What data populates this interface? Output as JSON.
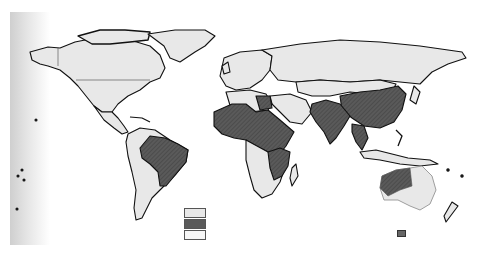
{
  "map": {
    "type": "world-choropleth",
    "style": "scanned grayscale",
    "colors": {
      "background": "#ffffff",
      "land_light": "#e8e8e8",
      "land_dark": "#5a5a5a",
      "border": "#111111",
      "legend_border": "#555555"
    },
    "highlighted_regions": [
      "Brazil",
      "West Africa",
      "Sahel / Central Africa",
      "Egypt",
      "Ethiopia / East Africa",
      "Southern Africa (Zambia, Zimbabwe, Mozambique)",
      "Pakistan",
      "India",
      "China",
      "Myanmar / Thailand",
      "Western & Northern Australia"
    ],
    "legend": {
      "items": [
        {
          "fill": "#e8e8e8",
          "label": ""
        },
        {
          "fill": "#5a5a5a",
          "label": ""
        },
        {
          "fill": "#f6f6f6",
          "label": ""
        }
      ]
    },
    "corner_marker": "small-square-mark"
  }
}
